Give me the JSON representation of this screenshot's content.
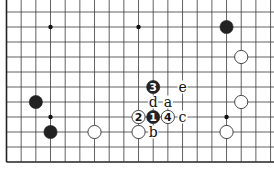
{
  "diagram": {
    "type": "go-board-fragment",
    "grid": {
      "origin_x": 6.5,
      "origin_y": 12,
      "dx": 14.67,
      "dy": 15,
      "cols": 19,
      "rows": 11,
      "left_edge": true,
      "bottom_edge": true,
      "top_edge": false,
      "right_edge": false,
      "line_color": "#3a3a3a",
      "edge_color": "#222222"
    },
    "hoshi": [
      {
        "col": 3,
        "row": 1
      },
      {
        "col": 9,
        "row": 1
      },
      {
        "col": 3,
        "row": 7
      },
      {
        "col": 15,
        "row": 7
      }
    ],
    "stones": [
      {
        "color": "black",
        "col": 15,
        "row": 1,
        "label": ""
      },
      {
        "color": "white",
        "col": 16,
        "row": 3,
        "label": ""
      },
      {
        "color": "black",
        "col": 2,
        "row": 6,
        "label": ""
      },
      {
        "color": "white",
        "col": 16,
        "row": 6,
        "label": ""
      },
      {
        "color": "black",
        "col": 3,
        "row": 8,
        "label": ""
      },
      {
        "color": "white",
        "col": 6,
        "row": 8,
        "label": ""
      },
      {
        "color": "white",
        "col": 9,
        "row": 8,
        "label": ""
      },
      {
        "color": "white",
        "col": 15,
        "row": 8,
        "label": ""
      },
      {
        "color": "black",
        "col": 10,
        "row": 7,
        "label": "1"
      },
      {
        "color": "white",
        "col": 9,
        "row": 7,
        "label": "2"
      },
      {
        "color": "black",
        "col": 10,
        "row": 5,
        "label": "3"
      },
      {
        "color": "white",
        "col": 11,
        "row": 7,
        "label": "4"
      }
    ],
    "marks": [
      {
        "text": "a",
        "col": 11,
        "row": 6
      },
      {
        "text": "b",
        "col": 10,
        "row": 8
      },
      {
        "text": "c",
        "col": 12,
        "row": 7
      },
      {
        "text": "d",
        "col": 10,
        "row": 6
      },
      {
        "text": "e",
        "col": 12,
        "row": 5
      }
    ],
    "colors": {
      "black_stone": "#222222",
      "white_stone": "#ffffff",
      "white_outline": "#333333",
      "background": "#ffffff"
    }
  }
}
